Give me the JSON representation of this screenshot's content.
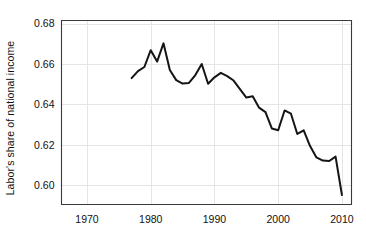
{
  "chart_data": {
    "type": "line",
    "title": "",
    "xlabel": "",
    "ylabel": "Labor's share of national income",
    "xlim": [
      1966,
      2011.5
    ],
    "ylim": [
      0.5905,
      0.6815
    ],
    "xticks": [
      1970,
      1980,
      1990,
      2000,
      2010
    ],
    "xtick_labels": [
      "1970",
      "1980",
      "1990",
      "2000",
      "2010"
    ],
    "yticks": [
      0.6,
      0.62,
      0.64,
      0.66,
      0.68
    ],
    "ytick_labels": [
      "0.60",
      "0.62",
      "0.64",
      "0.66",
      "0.68"
    ],
    "grid": "horizontal-and-vertical-light",
    "legend": "none",
    "line_color": "#151515",
    "grid_color": "#e2e2e6",
    "axis_color": "#3a3a3a",
    "background_color": "#ffffff",
    "series": [
      {
        "name": "Labor's share of national income",
        "x": [
          1977,
          1978,
          1979,
          1980,
          1981,
          1982,
          1983,
          1984,
          1985,
          1986,
          1987,
          1988,
          1989,
          1990,
          1991,
          1992,
          1993,
          1994,
          1995,
          1996,
          1997,
          1998,
          1999,
          2000,
          2001,
          2002,
          2003,
          2004,
          2005,
          2006,
          2007,
          2008,
          2009,
          2010
        ],
        "values": [
          0.653,
          0.6565,
          0.6585,
          0.6668,
          0.6612,
          0.6702,
          0.657,
          0.652,
          0.6503,
          0.6506,
          0.6545,
          0.66,
          0.6502,
          0.6534,
          0.6556,
          0.654,
          0.6518,
          0.6476,
          0.6434,
          0.644,
          0.6384,
          0.6362,
          0.6281,
          0.6272,
          0.637,
          0.6354,
          0.6254,
          0.6272,
          0.6194,
          0.6138,
          0.6122,
          0.612,
          0.6142,
          0.5952
        ]
      }
    ]
  }
}
